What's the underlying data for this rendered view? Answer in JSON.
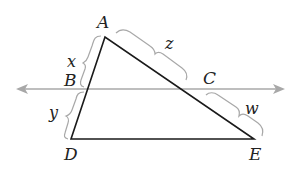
{
  "diagram": {
    "type": "geometry-triangle-with-parallel-transversal",
    "colors": {
      "triangle": "#1a1a1a",
      "line": "#a8a8a8",
      "brace": "#a8a8a8",
      "text": "#222222"
    },
    "points": {
      "A": {
        "label": "A",
        "x": 105,
        "y": 37
      },
      "B": {
        "label": "B",
        "x": 88,
        "y": 89
      },
      "C": {
        "label": "C",
        "x": 184,
        "y": 89
      },
      "D": {
        "label": "D",
        "x": 71,
        "y": 139
      },
      "E": {
        "label": "E",
        "x": 254,
        "y": 139
      }
    },
    "segments": {
      "x": {
        "label": "x",
        "from": "A",
        "to": "B"
      },
      "y": {
        "label": "y",
        "from": "B",
        "to": "D"
      },
      "z": {
        "label": "z",
        "from": "A",
        "to": "C"
      },
      "w": {
        "label": "w",
        "from": "C",
        "to": "E"
      }
    },
    "transversal": {
      "description": "line through B and C parallel to DE, arrows both ends",
      "y": 89,
      "x_start": 17,
      "x_end": 283
    }
  }
}
